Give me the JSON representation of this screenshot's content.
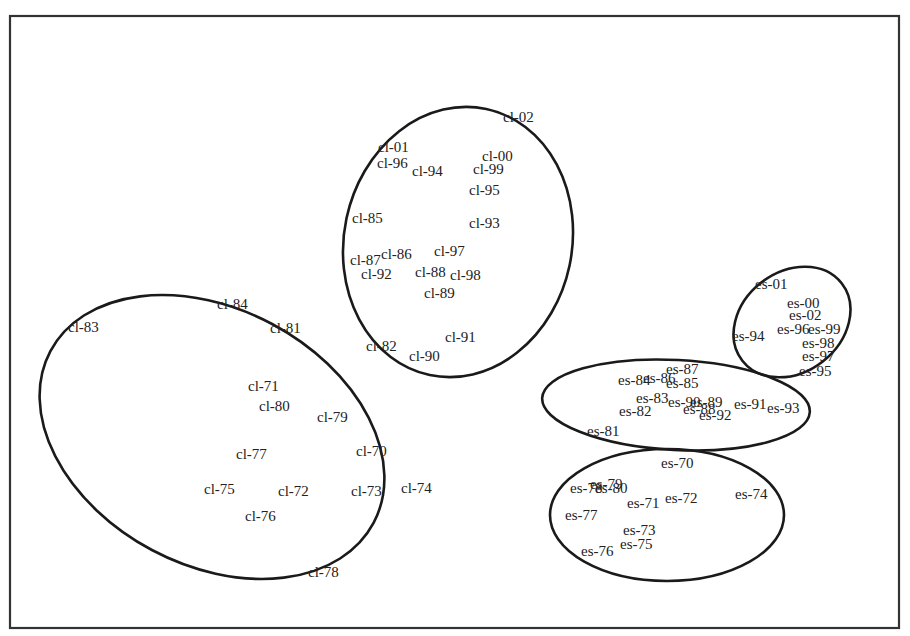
{
  "chart_data": {
    "type": "scatter",
    "title": "",
    "xlabel": "",
    "ylabel": "",
    "grid": false,
    "legend": null,
    "axes_visible": false,
    "frame": {
      "x": 10,
      "y": 16,
      "width": 889,
      "height": 612
    },
    "points": [
      {
        "label": "cl-02",
        "x": 503,
        "y": 122,
        "group": "cl-recent"
      },
      {
        "label": "cl-01",
        "x": 378,
        "y": 152,
        "group": "cl-recent"
      },
      {
        "label": "cl-96",
        "x": 377,
        "y": 168,
        "group": "cl-recent"
      },
      {
        "label": "cl-94",
        "x": 412,
        "y": 176,
        "group": "cl-recent"
      },
      {
        "label": "cl-00",
        "x": 482,
        "y": 161,
        "group": "cl-recent"
      },
      {
        "label": "cl-99",
        "x": 473,
        "y": 174,
        "group": "cl-recent"
      },
      {
        "label": "cl-95",
        "x": 469,
        "y": 195,
        "group": "cl-recent"
      },
      {
        "label": "cl-85",
        "x": 352,
        "y": 223,
        "group": "cl-recent"
      },
      {
        "label": "cl-93",
        "x": 469,
        "y": 228,
        "group": "cl-recent"
      },
      {
        "label": "cl-87",
        "x": 350,
        "y": 265,
        "group": "cl-recent"
      },
      {
        "label": "cl-86",
        "x": 381,
        "y": 259,
        "group": "cl-recent"
      },
      {
        "label": "cl-97",
        "x": 434,
        "y": 256,
        "group": "cl-recent"
      },
      {
        "label": "cl-92",
        "x": 361,
        "y": 279,
        "group": "cl-recent"
      },
      {
        "label": "cl-88",
        "x": 415,
        "y": 277,
        "group": "cl-recent"
      },
      {
        "label": "cl-98",
        "x": 450,
        "y": 280,
        "group": "cl-recent"
      },
      {
        "label": "cl-89",
        "x": 424,
        "y": 298,
        "group": "cl-recent"
      },
      {
        "label": "cl-82",
        "x": 366,
        "y": 351,
        "group": "cl-recent"
      },
      {
        "label": "cl-91",
        "x": 445,
        "y": 342,
        "group": "cl-recent"
      },
      {
        "label": "cl-90",
        "x": 409,
        "y": 361,
        "group": "cl-recent"
      },
      {
        "label": "cl-83",
        "x": 68,
        "y": 332,
        "group": "cl-early"
      },
      {
        "label": "cl-84",
        "x": 217,
        "y": 309,
        "group": "cl-early"
      },
      {
        "label": "cl-81",
        "x": 270,
        "y": 333,
        "group": "cl-early"
      },
      {
        "label": "cl-71",
        "x": 248,
        "y": 391,
        "group": "cl-early"
      },
      {
        "label": "cl-80",
        "x": 259,
        "y": 411,
        "group": "cl-early"
      },
      {
        "label": "cl-79",
        "x": 317,
        "y": 422,
        "group": "cl-early"
      },
      {
        "label": "cl-77",
        "x": 236,
        "y": 459,
        "group": "cl-early"
      },
      {
        "label": "cl-70",
        "x": 356,
        "y": 456,
        "group": "cl-early"
      },
      {
        "label": "cl-75",
        "x": 204,
        "y": 494,
        "group": "cl-early"
      },
      {
        "label": "cl-72",
        "x": 278,
        "y": 496,
        "group": "cl-early"
      },
      {
        "label": "cl-73",
        "x": 351,
        "y": 496,
        "group": "cl-early"
      },
      {
        "label": "cl-74",
        "x": 401,
        "y": 493,
        "group": "cl-early"
      },
      {
        "label": "cl-76",
        "x": 245,
        "y": 521,
        "group": "cl-early"
      },
      {
        "label": "cl-78",
        "x": 308,
        "y": 577,
        "group": "cl-early"
      },
      {
        "label": "es-01",
        "x": 755,
        "y": 289,
        "group": "es-recent"
      },
      {
        "label": "es-00",
        "x": 787,
        "y": 308,
        "group": "es-recent"
      },
      {
        "label": "es-02",
        "x": 789,
        "y": 320,
        "group": "es-recent"
      },
      {
        "label": "es-96",
        "x": 777,
        "y": 334,
        "group": "es-recent"
      },
      {
        "label": "es-99",
        "x": 808,
        "y": 334,
        "group": "es-recent"
      },
      {
        "label": "es-94",
        "x": 732,
        "y": 341,
        "group": "es-recent"
      },
      {
        "label": "es-98",
        "x": 802,
        "y": 348,
        "group": "es-recent"
      },
      {
        "label": "es-97",
        "x": 802,
        "y": 361,
        "group": "es-recent"
      },
      {
        "label": "es-95",
        "x": 799,
        "y": 376,
        "group": "es-recent"
      },
      {
        "label": "es-87",
        "x": 666,
        "y": 374,
        "group": "es-middle"
      },
      {
        "label": "es-84",
        "x": 618,
        "y": 385,
        "group": "es-middle"
      },
      {
        "label": "es-86",
        "x": 643,
        "y": 383,
        "group": "es-middle"
      },
      {
        "label": "es-85",
        "x": 666,
        "y": 388,
        "group": "es-middle"
      },
      {
        "label": "es-83",
        "x": 636,
        "y": 403,
        "group": "es-middle"
      },
      {
        "label": "es-90",
        "x": 668,
        "y": 407,
        "group": "es-middle"
      },
      {
        "label": "es-89",
        "x": 690,
        "y": 407,
        "group": "es-middle"
      },
      {
        "label": "es-82",
        "x": 619,
        "y": 416,
        "group": "es-middle"
      },
      {
        "label": "es-88",
        "x": 683,
        "y": 414,
        "group": "es-middle"
      },
      {
        "label": "es-92",
        "x": 699,
        "y": 420,
        "group": "es-middle"
      },
      {
        "label": "es-91",
        "x": 734,
        "y": 409,
        "group": "es-middle"
      },
      {
        "label": "es-93",
        "x": 767,
        "y": 413,
        "group": "es-middle"
      },
      {
        "label": "es-81",
        "x": 587,
        "y": 436,
        "group": "es-middle"
      },
      {
        "label": "es-70",
        "x": 661,
        "y": 468,
        "group": "es-early"
      },
      {
        "label": "es-78",
        "x": 570,
        "y": 493,
        "group": "es-early"
      },
      {
        "label": "es-79",
        "x": 590,
        "y": 489,
        "group": "es-early"
      },
      {
        "label": "es-80",
        "x": 595,
        "y": 493,
        "group": "es-early"
      },
      {
        "label": "es-71",
        "x": 627,
        "y": 508,
        "group": "es-early"
      },
      {
        "label": "es-72",
        "x": 665,
        "y": 503,
        "group": "es-early"
      },
      {
        "label": "es-74",
        "x": 735,
        "y": 499,
        "group": "es-early"
      },
      {
        "label": "es-77",
        "x": 565,
        "y": 520,
        "group": "es-early"
      },
      {
        "label": "es-73",
        "x": 623,
        "y": 535,
        "group": "es-early"
      },
      {
        "label": "es-75",
        "x": 620,
        "y": 549,
        "group": "es-early"
      },
      {
        "label": "es-76",
        "x": 581,
        "y": 556,
        "group": "es-early"
      }
    ],
    "clusters": [
      {
        "name": "cl-recent",
        "cx": 458,
        "cy": 242,
        "rx": 114,
        "ry": 136,
        "rotate": 12
      },
      {
        "name": "cl-early",
        "cx": 212,
        "cy": 437,
        "rx": 183,
        "ry": 128,
        "rotate": 28
      },
      {
        "name": "es-recent",
        "cx": 792,
        "cy": 322,
        "rx": 63,
        "ry": 50,
        "rotate": -38
      },
      {
        "name": "es-middle",
        "cx": 676,
        "cy": 405,
        "rx": 134,
        "ry": 45,
        "rotate": 3
      },
      {
        "name": "es-early",
        "cx": 667,
        "cy": 515,
        "rx": 117,
        "ry": 66,
        "rotate": 0
      }
    ]
  }
}
